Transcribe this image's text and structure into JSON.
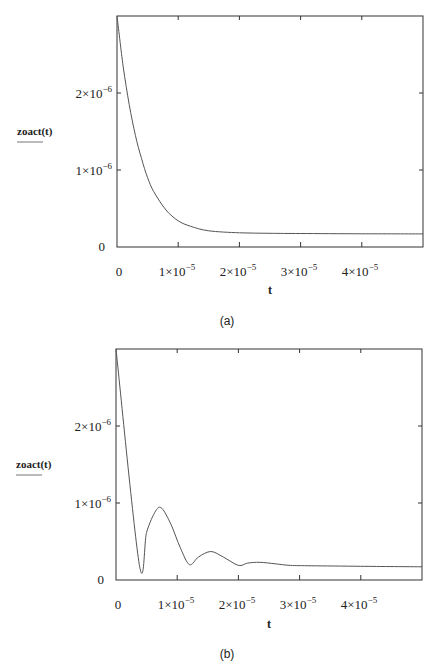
{
  "chart_data": [
    {
      "id": "a",
      "type": "line",
      "caption": "(a)",
      "title": "",
      "xlabel": "t",
      "ylabel": "zoact(t)",
      "xlim": [
        0,
        5e-05
      ],
      "ylim": [
        0,
        3e-06
      ],
      "grid": false,
      "x_ticks": [
        "0",
        "1×10^-5",
        "2×10^-5",
        "3×10^-5",
        "4×10^-5"
      ],
      "y_ticks": [
        "0",
        "1×10^-6",
        "2×10^-6"
      ],
      "series": [
        {
          "name": "zoact(t)",
          "x": [
            0,
            1e-06,
            2e-06,
            3e-06,
            4e-06,
            5e-06,
            6e-06,
            8e-06,
            1e-05,
            1.2e-05,
            1.5e-05,
            2e-05,
            2.5e-05,
            3e-05,
            4e-05,
            5e-05
          ],
          "values": [
            3e-06,
            2.35e-06,
            1.85e-06,
            1.45e-06,
            1.15e-06,
            9e-07,
            7.2e-07,
            4.8e-07,
            3.4e-07,
            2.7e-07,
            2.1e-07,
            1.85e-07,
            1.78e-07,
            1.75e-07,
            1.72e-07,
            1.7e-07
          ]
        }
      ]
    },
    {
      "id": "b",
      "type": "line",
      "caption": "(b)",
      "title": "",
      "xlabel": "t",
      "ylabel": "zoact(t)",
      "xlim": [
        0,
        5e-05
      ],
      "ylim": [
        0,
        3e-06
      ],
      "grid": false,
      "x_ticks": [
        "0",
        "1×10^-5",
        "2×10^-5",
        "3×10^-5",
        "4×10^-5"
      ],
      "y_ticks": [
        "0",
        "1×10^-6",
        "2×10^-6"
      ],
      "series": [
        {
          "name": "zoact(t)",
          "x": [
            0,
            3.8e-06,
            5e-06,
            6.5e-06,
            7.5e-06,
            9e-06,
            1.05e-05,
            1.2e-05,
            1.35e-05,
            1.55e-05,
            1.75e-05,
            2e-05,
            2.15e-05,
            2.35e-05,
            2.6e-05,
            2.85e-05,
            3.2e-05,
            4e-05,
            5e-05
          ],
          "values": [
            3e-06,
            2e-07,
            6.2e-07,
            9e-07,
            9.3e-07,
            7.2e-07,
            4.2e-07,
            2e-07,
            3e-07,
            3.7e-07,
            3e-07,
            1.9e-07,
            2.2e-07,
            2.3e-07,
            2.1e-07,
            1.9e-07,
            1.85e-07,
            1.78e-07,
            1.72e-07
          ]
        }
      ]
    }
  ],
  "panels": [
    {
      "caption": "(a)",
      "y_axis_label": "zoact(t)",
      "x_axis_label": "t",
      "y_tick_labels": [
        {
          "base": "0",
          "exp": ""
        },
        {
          "base": "1×10",
          "exp": "−6"
        },
        {
          "base": "2×10",
          "exp": "−6"
        }
      ],
      "x_tick_labels": [
        {
          "base": "0",
          "exp": ""
        },
        {
          "base": "1×10",
          "exp": "−5"
        },
        {
          "base": "2×10",
          "exp": "−5"
        },
        {
          "base": "3×10",
          "exp": "−5"
        },
        {
          "base": "4×10",
          "exp": "−5"
        }
      ]
    },
    {
      "caption": "(b)",
      "y_axis_label": "zoact(t)",
      "x_axis_label": "t",
      "y_tick_labels": [
        {
          "base": "0",
          "exp": ""
        },
        {
          "base": "1×10",
          "exp": "−6"
        },
        {
          "base": "2×10",
          "exp": "−6"
        }
      ],
      "x_tick_labels": [
        {
          "base": "0",
          "exp": ""
        },
        {
          "base": "1×10",
          "exp": "−5"
        },
        {
          "base": "2×10",
          "exp": "−5"
        },
        {
          "base": "3×10",
          "exp": "−5"
        },
        {
          "base": "4×10",
          "exp": "−5"
        }
      ]
    }
  ],
  "colors": {
    "frame": "#333333",
    "curve": "#555555",
    "text": "#222222"
  }
}
